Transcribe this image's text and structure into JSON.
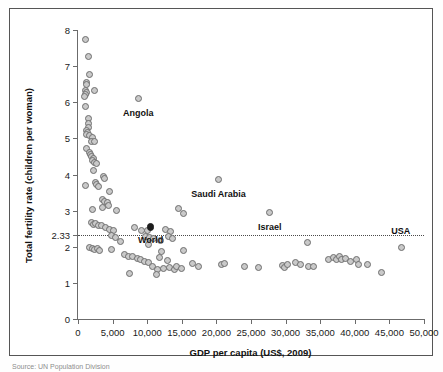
{
  "figure": {
    "source_note": "Source: UN Population Division"
  },
  "chart_data": {
    "type": "scatter",
    "title": "",
    "xlabel": "GDP per capita (US$, 2009)",
    "ylabel": "Total fertility rate (children per woman)",
    "xlim": [
      0,
      50000
    ],
    "ylim": [
      0,
      8
    ],
    "grid": false,
    "legend": "none",
    "xticks": [
      0,
      5000,
      10000,
      15000,
      20000,
      25000,
      30000,
      35000,
      40000,
      45000,
      50000
    ],
    "xticklabels": [
      "0",
      "5,000",
      "10,000",
      "15,000",
      "20,000",
      "25,000",
      "30,000",
      "35,000",
      "40,000",
      "45,000",
      "50,000"
    ],
    "yticks": [
      0,
      1,
      2,
      2.33,
      3,
      4,
      5,
      6,
      7,
      8
    ],
    "yticklabels": [
      "0",
      "1",
      "2",
      "2.33",
      "3",
      "4",
      "5",
      "6",
      "7",
      "8"
    ],
    "reference_line": {
      "orientation": "horizontal",
      "value": 2.33,
      "label": "2.33",
      "style": "dotted"
    },
    "annotations": [
      {
        "label": "Angola",
        "x": 8700,
        "y": 6.1,
        "label_dx": 0,
        "label_dy": -0.42
      },
      {
        "label": "Saudi Arabia",
        "x": 20300,
        "y": 3.85,
        "label_dx": 0,
        "label_dy": -0.42
      },
      {
        "label": "Israel",
        "x": 27700,
        "y": 2.95,
        "label_dx": 0,
        "label_dy": -0.42
      },
      {
        "label": "World",
        "x": 10500,
        "y": 2.55,
        "label_dx": 0,
        "label_dy": -0.4
      },
      {
        "label": "USA",
        "x": 46700,
        "y": 1.98,
        "label_dx": -0.5,
        "label_dy": 0.42
      }
    ],
    "highlight_point": {
      "label": "World",
      "x": 10500,
      "y": 2.55,
      "style": "filled"
    },
    "points": [
      [
        1150,
        7.75
      ],
      [
        1500,
        7.28
      ],
      [
        1600,
        6.78
      ],
      [
        1250,
        6.55
      ],
      [
        1280,
        6.48
      ],
      [
        1120,
        6.33
      ],
      [
        1180,
        6.26
      ],
      [
        1060,
        6.22
      ],
      [
        1010,
        6.17
      ],
      [
        2350,
        6.33
      ],
      [
        8700,
        6.1
      ],
      [
        1100,
        5.88
      ],
      [
        1450,
        5.55
      ],
      [
        1500,
        5.42
      ],
      [
        1560,
        5.3
      ],
      [
        1300,
        5.22
      ],
      [
        1350,
        5.16
      ],
      [
        1220,
        5.12
      ],
      [
        1700,
        5.08
      ],
      [
        2100,
        5.02
      ],
      [
        1900,
        4.92
      ],
      [
        2450,
        4.9
      ],
      [
        1280,
        4.72
      ],
      [
        1600,
        4.62
      ],
      [
        1750,
        4.55
      ],
      [
        1950,
        4.5
      ],
      [
        2200,
        4.44
      ],
      [
        2050,
        4.38
      ],
      [
        2400,
        4.33
      ],
      [
        2650,
        4.3
      ],
      [
        2300,
        4.1
      ],
      [
        1050,
        3.7
      ],
      [
        3700,
        3.95
      ],
      [
        3800,
        3.88
      ],
      [
        2550,
        3.78
      ],
      [
        2700,
        3.72
      ],
      [
        2900,
        3.66
      ],
      [
        4600,
        3.52
      ],
      [
        20300,
        3.85
      ],
      [
        3500,
        3.3
      ],
      [
        3800,
        3.26
      ],
      [
        4200,
        3.22
      ],
      [
        4400,
        3.15
      ],
      [
        3600,
        3.08
      ],
      [
        5500,
        3.0
      ],
      [
        2100,
        3.02
      ],
      [
        14500,
        3.05
      ],
      [
        15200,
        2.93
      ],
      [
        27700,
        2.95
      ],
      [
        1950,
        2.66
      ],
      [
        2250,
        2.62
      ],
      [
        2600,
        2.64
      ],
      [
        3000,
        2.6
      ],
      [
        3350,
        2.58
      ],
      [
        4000,
        2.52
      ],
      [
        4500,
        2.48
      ],
      [
        5100,
        2.44
      ],
      [
        8200,
        2.52
      ],
      [
        9200,
        2.46
      ],
      [
        10000,
        2.44
      ],
      [
        12700,
        2.48
      ],
      [
        13400,
        2.42
      ],
      [
        10500,
        2.55
      ],
      [
        4800,
        2.3
      ],
      [
        5400,
        2.26
      ],
      [
        9700,
        2.28
      ],
      [
        10400,
        2.25
      ],
      [
        10900,
        2.22
      ],
      [
        13100,
        2.28
      ],
      [
        13600,
        2.24
      ],
      [
        6100,
        2.14
      ],
      [
        10200,
        2.06
      ],
      [
        11900,
        2.18
      ],
      [
        1700,
        1.98
      ],
      [
        2100,
        1.95
      ],
      [
        2450,
        1.92
      ],
      [
        2800,
        1.96
      ],
      [
        3100,
        1.9
      ],
      [
        4900,
        1.92
      ],
      [
        12000,
        1.88
      ],
      [
        15300,
        1.9
      ],
      [
        33100,
        2.12
      ],
      [
        46700,
        1.98
      ],
      [
        6700,
        1.78
      ],
      [
        7300,
        1.74
      ],
      [
        7900,
        1.72
      ],
      [
        8600,
        1.68
      ],
      [
        9100,
        1.64
      ],
      [
        11800,
        1.7
      ],
      [
        12900,
        1.62
      ],
      [
        9600,
        1.6
      ],
      [
        10200,
        1.56
      ],
      [
        16600,
        1.55
      ],
      [
        17400,
        1.45
      ],
      [
        20700,
        1.5
      ],
      [
        21100,
        1.54
      ],
      [
        24000,
        1.44
      ],
      [
        26100,
        1.43
      ],
      [
        29600,
        1.48
      ],
      [
        29900,
        1.42
      ],
      [
        30300,
        1.52
      ],
      [
        31400,
        1.56
      ],
      [
        32200,
        1.5
      ],
      [
        33300,
        1.44
      ],
      [
        34100,
        1.46
      ],
      [
        36200,
        1.66
      ],
      [
        36900,
        1.7
      ],
      [
        37300,
        1.66
      ],
      [
        37800,
        1.72
      ],
      [
        38100,
        1.64
      ],
      [
        38600,
        1.68
      ],
      [
        39400,
        1.6
      ],
      [
        40300,
        1.64
      ],
      [
        40500,
        1.5
      ],
      [
        41900,
        1.52
      ],
      [
        43800,
        1.3
      ],
      [
        10800,
        1.45
      ],
      [
        11500,
        1.38
      ],
      [
        12300,
        1.4
      ],
      [
        13200,
        1.42
      ],
      [
        13900,
        1.36
      ],
      [
        7400,
        1.26
      ],
      [
        11300,
        1.22
      ],
      [
        14300,
        1.44
      ],
      [
        15000,
        1.4
      ]
    ]
  }
}
